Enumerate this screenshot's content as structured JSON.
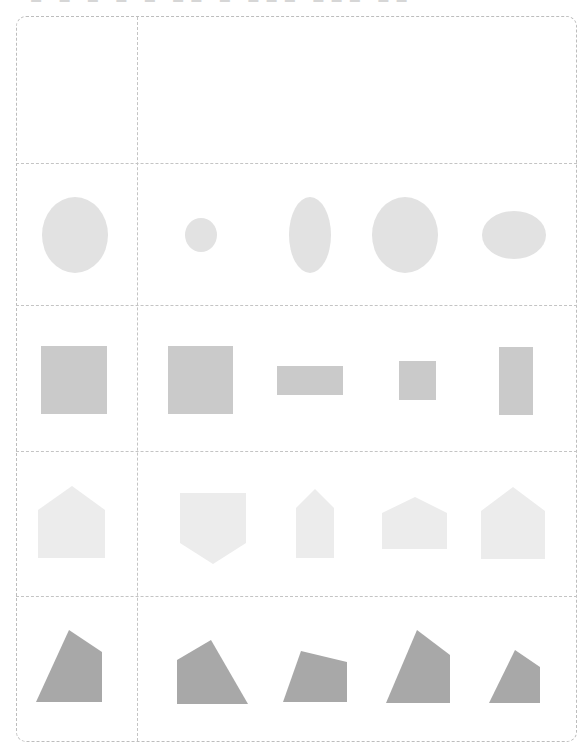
{
  "header": {
    "clipped_title": "▬ ▬ ▬ ▬ ▬ ▬▬ ▬ ▬▬▬ ▬▬▬ ▬▬"
  },
  "worksheet": {
    "layout": {
      "left": 16,
      "top": 16,
      "right": 577,
      "bottom": 742,
      "column_divider_x": 137,
      "row_dividers_y": [
        163,
        305,
        451,
        596
      ]
    },
    "colors": {
      "border": "#bdbdbd",
      "circle_fill": "#e2e2e2",
      "rect_fill": "#cacaca",
      "pentagon_fill": "#ececec",
      "quad_fill": "#a8a8a8"
    },
    "rows": [
      {
        "name": "header-row",
        "reference": null,
        "options": []
      },
      {
        "name": "ellipse-row",
        "reference": {
          "cx": 75,
          "cy": 235,
          "rx": 33,
          "ry": 38
        },
        "options": [
          {
            "cx": 201,
            "cy": 235,
            "rx": 16,
            "ry": 17
          },
          {
            "cx": 310,
            "cy": 235,
            "rx": 21,
            "ry": 38
          },
          {
            "cx": 405,
            "cy": 235,
            "rx": 33,
            "ry": 38
          },
          {
            "cx": 514,
            "cy": 235,
            "rx": 32,
            "ry": 24
          }
        ]
      },
      {
        "name": "rectangle-row",
        "reference": {
          "x": 41,
          "y": 346,
          "w": 66,
          "h": 68
        },
        "options": [
          {
            "x": 168,
            "y": 346,
            "w": 65,
            "h": 68
          },
          {
            "x": 277,
            "y": 366,
            "w": 66,
            "h": 29
          },
          {
            "x": 399,
            "y": 361,
            "w": 37,
            "h": 39
          },
          {
            "x": 499,
            "y": 347,
            "w": 34,
            "h": 68
          }
        ]
      },
      {
        "name": "pentagon-row",
        "reference": "38,510 72,486 105,510 105,558 38,558",
        "options": [
          "180,493 246,493 246,543 213,564 180,543",
          "296,508 315,489 334,508 334,558 296,558",
          "382,513 415,497 447,513 447,549 382,549",
          "481,511 513,487 545,511 545,559 481,559"
        ]
      },
      {
        "name": "quadrilateral-row",
        "reference": "36,702 69,630 102,652 102,702",
        "options": [
          "177,660 211,640 248,704 177,704",
          "283,702 301,651 347,662 347,702",
          "386,703 417,630 450,655 450,703",
          "489,703 515,650 540,667 540,703"
        ]
      }
    ]
  }
}
